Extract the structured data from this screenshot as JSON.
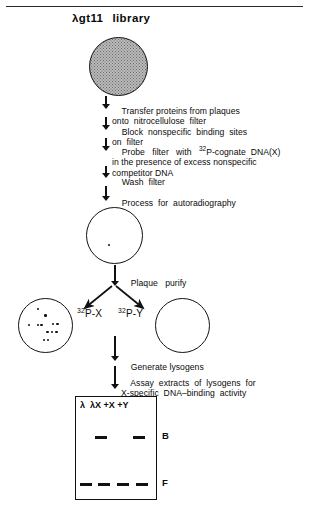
{
  "figure": {
    "title_lambda": "λ",
    "title_rest": "gt11",
    "title_word": "library",
    "top_rule": true
  },
  "steps": [
    {
      "id": "transfer",
      "lines": [
        "Transfer proteins from plaques",
        "onto  nitrocellulose  filter"
      ]
    },
    {
      "id": "block",
      "lines": [
        "Block  nonspecific  binding  sites",
        "on  filter"
      ]
    },
    {
      "id": "probe",
      "lines": [
        "Probe   filter   with   ",
        "P-cognate  DNA(X)",
        "in the presence of excess nonspecific",
        "competitor DNA"
      ],
      "superscript": "32"
    },
    {
      "id": "wash",
      "lines": [
        "Wash  filter"
      ]
    },
    {
      "id": "autoradiography",
      "lines": [
        "Process  for  autoradiography"
      ]
    },
    {
      "id": "plaque-purify",
      "lines": [
        "Plaque   purify"
      ]
    },
    {
      "id": "generate-lysogens",
      "lines": [
        "Generate lysogens"
      ]
    },
    {
      "id": "assay",
      "lines": [
        "Assay  extracts  of  lysogens  for",
        "X-specific  DNA–binding  activity"
      ]
    }
  ],
  "circles": {
    "library_plate": {
      "label": "lambda-gt11-library-plate",
      "fill": "stippled"
    },
    "autorad_plate": {
      "label": "autoradiograph-plate",
      "dots": 1
    },
    "positive_plate": {
      "label": "positive-plaque-plate",
      "dots": [
        [
          0.34,
          0.18
        ],
        [
          0.48,
          0.3
        ],
        [
          0.18,
          0.47
        ],
        [
          0.34,
          0.47
        ],
        [
          0.41,
          0.47
        ],
        [
          0.62,
          0.45
        ],
        [
          0.7,
          0.45
        ],
        [
          0.52,
          0.6
        ],
        [
          0.6,
          0.6
        ],
        [
          0.68,
          0.6
        ],
        [
          0.45,
          0.74
        ],
        [
          0.53,
          0.74
        ]
      ]
    },
    "negative_plate": {
      "label": "negative-plaque-plate",
      "dots": []
    }
  },
  "isotope_labels": {
    "left": {
      "sup": "32",
      "text": "P-X"
    },
    "right": {
      "sup": "32",
      "text": "P-Y"
    }
  },
  "gel": {
    "lane_headers": [
      "λ",
      "λX",
      "+X",
      "+Y"
    ],
    "lane_header_line": "λ  λX +X +Y",
    "rows": [
      {
        "name": "B",
        "label": "B",
        "lanes": [
          0,
          1,
          0,
          1
        ]
      },
      {
        "name": "F",
        "label": "F",
        "lanes": [
          1,
          1,
          1,
          1
        ]
      }
    ]
  },
  "colors": {
    "ink": "#111111",
    "rule": "#2b2b2b",
    "plate_fill": "#b9b9b9",
    "background": "#ffffff"
  }
}
